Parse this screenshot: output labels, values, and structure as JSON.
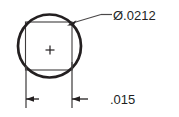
{
  "drawing": {
    "title": "Hole feature detail",
    "background_color": "#ffffff",
    "line_color": "#231f20",
    "text_color": "#221f1f",
    "callouts": [
      {
        "id": "diameter-callout",
        "label": "Ø.0212",
        "symbol": "diameter-symbol",
        "value": ".0212",
        "kind": "leader-dimension",
        "text_x": 113,
        "text_y": 20
      },
      {
        "id": "width-dimension",
        "label": ".015",
        "value": ".015",
        "kind": "linear-dimension",
        "text_x": 110,
        "text_y": 104
      }
    ],
    "geometry": {
      "circle": {
        "name": "bounding-circle",
        "cx": 49.5,
        "cy": 46,
        "r": 31.5,
        "stroke_width": 2.6
      },
      "square": {
        "name": "inscribed-square",
        "x": 25.5,
        "y": 22,
        "width": 46.5,
        "height": 48,
        "stroke_width": 1
      },
      "center_mark": {
        "name": "center-crosshair",
        "cx": 50,
        "cy": 50,
        "size": 5
      },
      "extension_lines": [
        {
          "name": "extension-line-left",
          "x": 26,
          "y1": 66,
          "y2": 108
        },
        {
          "name": "extension-line-right",
          "x": 72,
          "y1": 62,
          "y2": 108
        }
      ],
      "dimension_arrows": [
        {
          "name": "dimension-arrow-left",
          "tip_x": 26,
          "tip_y": 99,
          "direction": "left",
          "tail_x": 38
        },
        {
          "name": "dimension-arrow-right",
          "tip_x": 72,
          "tip_y": 99,
          "direction": "left",
          "tail_x": 86
        }
      ],
      "leader": {
        "name": "diameter-leader-line",
        "arrow_tip_x": 67,
        "arrow_tip_y": 23,
        "elbow_x": 103,
        "elbow_y": 14,
        "shelf_end_x": 112,
        "shelf_y": 14
      }
    }
  }
}
